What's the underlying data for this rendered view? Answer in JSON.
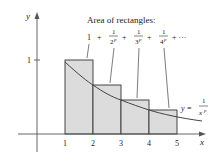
{
  "diagram": {
    "title": "Area of rectangles:",
    "series_terms": [
      {
        "id": "t1",
        "text": "1"
      },
      {
        "id": "t2",
        "num": "1",
        "den": "2",
        "exp": "p"
      },
      {
        "id": "t3",
        "num": "1",
        "den": "3",
        "exp": "p"
      },
      {
        "id": "t4",
        "num": "1",
        "den": "4",
        "exp": "p"
      }
    ],
    "plus": "+",
    "ellipsis": "+ ···",
    "curve_label": {
      "lhs": "y =",
      "num": "1",
      "den": "x",
      "exp": "p"
    },
    "axes": {
      "x_label": "x",
      "y_label": "y",
      "x_ticks": [
        "1",
        "2",
        "3",
        "4",
        "5"
      ],
      "y_ticks": [
        "1"
      ]
    },
    "rectangles": [
      {
        "x_from": 1,
        "x_to": 2,
        "height": "1"
      },
      {
        "x_from": 2,
        "x_to": 3,
        "height": "1/2^p"
      },
      {
        "x_from": 3,
        "x_to": 4,
        "height": "1/3^p"
      },
      {
        "x_from": 4,
        "x_to": 5,
        "height": "1/4^p"
      }
    ],
    "colors": {
      "fill": "#dcdcdc",
      "stroke": "#333333",
      "curve": "#444444"
    }
  }
}
